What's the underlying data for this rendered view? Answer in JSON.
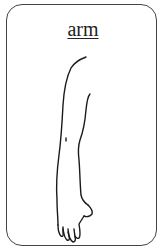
{
  "card": {
    "title": "arm",
    "illustration": "arm-illustration",
    "border_color": "#444444",
    "text_color": "#222222"
  }
}
